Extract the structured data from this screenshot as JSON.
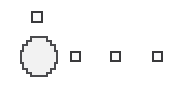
{
  "canvas": {
    "width": 191,
    "height": 91,
    "background_color": "#ffffff",
    "name": "diagram-canvas"
  },
  "style": {
    "node_fill": "#fbfbfb",
    "node_stroke": "#3a3a3c",
    "blob_fill": "#f2f2f2",
    "blob_stroke": "#4a4a4d",
    "stroke_width": 2
  },
  "nodes": [
    {
      "id": "node-top-square",
      "shape": "square",
      "label": "",
      "x": 31,
      "y": 11,
      "width": 12,
      "height": 12
    },
    {
      "id": "node-blob",
      "shape": "octagon-blob",
      "label": "",
      "x": 20,
      "y": 36,
      "width": 38,
      "height": 41
    },
    {
      "id": "node-row-1",
      "shape": "square",
      "label": "",
      "x": 70,
      "y": 51,
      "width": 11,
      "height": 11
    },
    {
      "id": "node-row-2",
      "shape": "square",
      "label": "",
      "x": 110,
      "y": 51,
      "width": 11,
      "height": 11
    },
    {
      "id": "node-row-3",
      "shape": "square",
      "label": "",
      "x": 152,
      "y": 51,
      "width": 11,
      "height": 11
    }
  ],
  "edges": [],
  "accessibility": {
    "canvas_description": "Diagram canvas with one large octagonal node and four small square nodes"
  }
}
